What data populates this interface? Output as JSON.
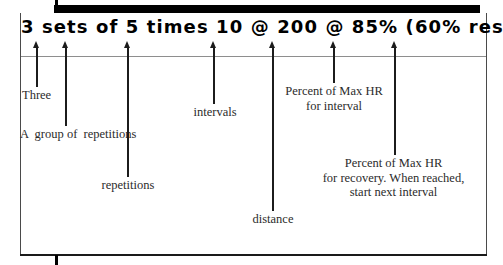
{
  "figure": {
    "headline": "3 sets of 5 times 10 @ 200 @ 85% (60% rest)",
    "ink_color": "#000000",
    "rule_color": "#8e8e8e",
    "text_color": "#2b2b2b"
  },
  "annotations": [
    {
      "id": "sets",
      "label": "Three",
      "arrow_x": 37,
      "line_bottom": 87
    },
    {
      "id": "group",
      "label": "A  group of  repetitions",
      "arrow_x": 66,
      "line_bottom": 126
    },
    {
      "id": "reps",
      "label": "repetitions",
      "arrow_x": 128,
      "line_bottom": 177
    },
    {
      "id": "intervals",
      "label": "intervals",
      "arrow_x": 214,
      "line_bottom": 104
    },
    {
      "id": "distance",
      "label": "distance",
      "arrow_x": 273,
      "line_bottom": 211
    },
    {
      "id": "hr_interval",
      "label": "Percent of Max HR\nfor interval",
      "arrow_x": 334,
      "line_bottom": 83
    },
    {
      "id": "hr_recovery",
      "label": "Percent of Max HR\nfor recovery. When reached,\nstart next interval",
      "arrow_x": 395,
      "line_bottom": 155
    }
  ]
}
